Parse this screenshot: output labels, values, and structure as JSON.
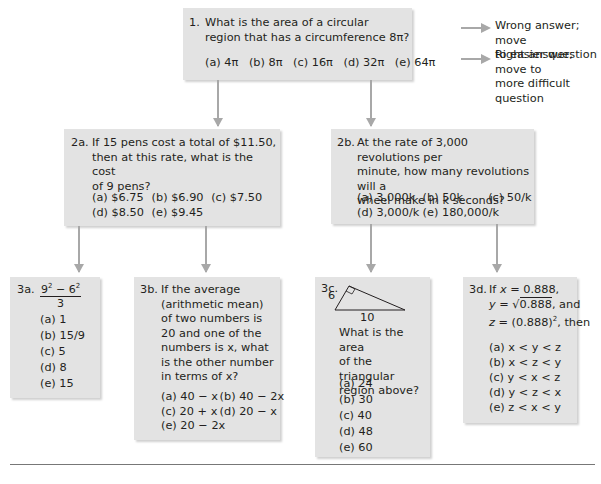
{
  "legend": {
    "wrong": "Wrong answer; move to easier question",
    "wrong_lines": [
      "Wrong answer; move",
      "to easier question"
    ],
    "right": "Right answer; move to more difficult question",
    "right_lines": [
      "Right answer; move to",
      "more difficult question"
    ],
    "arrow_color": "#a8a8a8"
  },
  "box_color": "#e3e3e3",
  "questions": {
    "q1": {
      "number": "1.",
      "lines": [
        "What is the area of a circular",
        "region that has a circumference 8π?"
      ],
      "options": [
        "(a) 4π",
        "(b) 8π",
        "(c) 16π",
        "(d) 32π",
        "(e) 64π"
      ]
    },
    "q2a": {
      "number": "2a.",
      "lines": [
        "If 15 pens cost a total of $11.50,",
        "then at this rate, what is the cost",
        "of 9 pens?"
      ],
      "options": [
        "(a) $6.75",
        "(b) $6.90",
        "(c) $7.50",
        "(d) $8.50",
        "(e) $9.45"
      ]
    },
    "q2b": {
      "number": "2b.",
      "lines": [
        "At the rate of 3,000 revolutions per",
        "minute, how many revolutions will a",
        "wheel make in k seconds?"
      ],
      "options": [
        "(a) 3,000k",
        "(b) 50k",
        "(c) 50/k",
        "(d) 3,000/k",
        "(e) 180,000/k"
      ]
    },
    "q3a": {
      "number": "3a.",
      "expression": "(9² − 6²) / 3",
      "numerator": "9² − 6²",
      "denominator": "3",
      "options": [
        "(a) 1",
        "(b) 15/9",
        "(c) 5",
        "(d) 8",
        "(e) 15"
      ]
    },
    "q3b": {
      "number": "3b.",
      "lines": [
        "If the average",
        "(arithmetic mean)",
        "of two numbers is",
        "20 and one of the",
        "numbers is x, what",
        "is the other number",
        "in terms of x?"
      ],
      "options": [
        "(a) 40 − x",
        "(b) 40 − 2x",
        "(c) 20 + x",
        "(d) 20 − x",
        "(e) 20 − 2x"
      ]
    },
    "q3c": {
      "number": "3c.",
      "figure": {
        "side_label": "6",
        "base_label": "10"
      },
      "lines": [
        "What is the area",
        "of the triangular",
        "region above?"
      ],
      "options": [
        "(a) 24",
        "(b) 30",
        "(c) 40",
        "(d) 48",
        "(e) 60"
      ]
    },
    "q3d": {
      "number": "3d.",
      "lines": [
        "If x = 0.888,",
        "y = √0.888, and",
        "z = (0.888)², then"
      ],
      "options": [
        "(a) x < y < z",
        "(b) x < z < y",
        "(c) y < x < z",
        "(d) y < z < x",
        "(e) z < x < y"
      ]
    }
  }
}
